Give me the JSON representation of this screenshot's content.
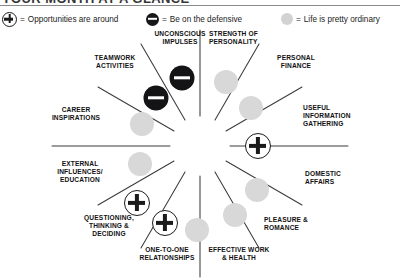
{
  "masthead": {
    "title": "YOUR MONTH AT A GLANCE"
  },
  "legend": {
    "items": [
      {
        "symbol": "plus-circle-icon",
        "equals": "=",
        "label": "Opportunities are around"
      },
      {
        "symbol": "minus-circle-icon",
        "equals": "=",
        "label": "Be on the defensive"
      },
      {
        "symbol": "gray-circle-icon",
        "equals": "=",
        "label": "Life is pretty ordinary"
      }
    ]
  },
  "wheel": {
    "sectors": [
      {
        "label": "UNCONSCIOUS IMPULSES",
        "marker": "minus"
      },
      {
        "label": "STRENGTH OF PERSONALITY",
        "marker": "gray"
      },
      {
        "label": "PERSONAL FINANCE",
        "marker": "gray"
      },
      {
        "label": "USEFUL INFORMATION GATHERING",
        "marker": "plus"
      },
      {
        "label": "DOMESTIC AFFAIRS",
        "marker": "gray"
      },
      {
        "label": "PLEASURE & ROMANCE",
        "marker": "gray"
      },
      {
        "label": "EFFECTIVE WORK & HEALTH",
        "marker": "gray"
      },
      {
        "label": "ONE-TO-ONE RELATIONSHIPS",
        "marker": "plus"
      },
      {
        "label": "QUESTIONING, THINKING & DECIDING",
        "marker": "plus"
      },
      {
        "label": "EXTERNAL INFLUENCES/ EDUCATION",
        "marker": "gray"
      },
      {
        "label": "CAREER INSPIRATIONS",
        "marker": "gray"
      },
      {
        "label": "TEAMWORK ACTIVITIES",
        "marker": "minus"
      }
    ]
  }
}
